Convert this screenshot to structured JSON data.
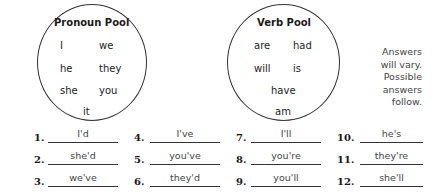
{
  "pronoun_pool": {
    "title": "Pronoun Pool",
    "words": [
      "I",
      "we",
      "he",
      "they",
      "she",
      "you",
      "it"
    ]
  },
  "verb_pool": {
    "title": "Verb Pool",
    "words": [
      "are",
      "had",
      "will",
      "is",
      "have",
      "am"
    ]
  },
  "note": {
    "lines": [
      "Answers",
      "will vary.",
      "Possible",
      "answers",
      "follow."
    ]
  },
  "answers": [
    {
      "num": "1.",
      "answer": "I'd"
    },
    {
      "num": "2.",
      "answer": "she'd"
    },
    {
      "num": "3.",
      "answer": "we've"
    },
    {
      "num": "4.",
      "answer": "I've"
    },
    {
      "num": "5.",
      "answer": "you've"
    },
    {
      "num": "6.",
      "answer": "they'd"
    },
    {
      "num": "7.",
      "answer": "I'll"
    },
    {
      "num": "8.",
      "answer": "you're"
    },
    {
      "num": "9.",
      "answer": "you'll"
    },
    {
      "num": "10.",
      "answer": "he's"
    },
    {
      "num": "11.",
      "answer": "they're"
    },
    {
      "num": "12.",
      "answer": "she'll"
    }
  ]
}
